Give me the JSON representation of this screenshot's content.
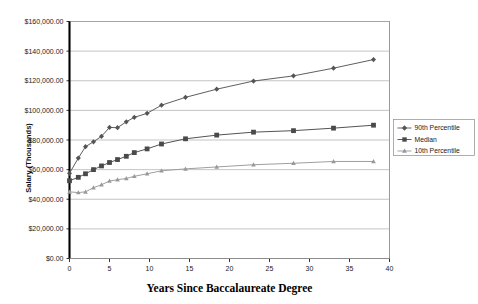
{
  "chart_data": {
    "type": "line",
    "title": "",
    "xlabel": "Years Since Baccalaureate Degree",
    "ylabel": "Salary (Thousands)",
    "xlim": [
      0,
      40
    ],
    "ylim": [
      0,
      160000
    ],
    "xticks": [
      0,
      5,
      10,
      15,
      20,
      25,
      30,
      35,
      40
    ],
    "xtick_labels": [
      "0",
      "5",
      "10",
      "15",
      "20",
      "25",
      "30",
      "35",
      "40"
    ],
    "yticks": [
      0,
      20000,
      40000,
      60000,
      80000,
      100000,
      120000,
      140000,
      160000
    ],
    "ytick_labels": [
      "$0.00",
      "$20,000.00",
      "$40,000.00",
      "$60,000.00",
      "$80,000.00",
      "$100,000.00",
      "$120,000.00",
      "$140,000.00",
      "$160,000.00"
    ],
    "grid": "horizontal",
    "legend_position": "right",
    "x": [
      0,
      1.1,
      2.0,
      3.0,
      4.0,
      5.0,
      6.0,
      7.1,
      8.1,
      9.7,
      11.5,
      14.5,
      18.4,
      23.0,
      28.0,
      33.0,
      38.0
    ],
    "series": [
      {
        "name": "90th Percentile",
        "marker": "diamond",
        "color": "#555555",
        "values": [
          57500,
          67800,
          75500,
          78800,
          82500,
          88500,
          88300,
          92300,
          95300,
          98000,
          103500,
          108800,
          114300,
          119800,
          123300,
          128500,
          134300
        ]
      },
      {
        "name": "Median",
        "marker": "square",
        "color": "#4a4a4a",
        "values": [
          52500,
          54800,
          57200,
          60000,
          62500,
          64800,
          66800,
          69000,
          71500,
          74000,
          77300,
          80800,
          83300,
          85300,
          86300,
          88000,
          90000
        ]
      },
      {
        "name": "10th Percentile",
        "marker": "triangle",
        "color": "#999999",
        "values": [
          45000,
          44500,
          45000,
          47800,
          49800,
          52300,
          53200,
          54000,
          55500,
          57200,
          59200,
          60500,
          61800,
          63300,
          64300,
          65500,
          65500
        ]
      }
    ]
  },
  "legend": {
    "items": [
      {
        "label": "90th Percentile",
        "marker": "diamond",
        "color": "#555555"
      },
      {
        "label": "Median",
        "marker": "square",
        "color": "#4a4a4a"
      },
      {
        "label": "10th Percentile",
        "marker": "triangle",
        "color": "#999999"
      }
    ]
  },
  "style": {
    "background": "#ffffff",
    "plot_border": "#808080",
    "gridline": "#aaaaaa",
    "axis": "#000000"
  }
}
